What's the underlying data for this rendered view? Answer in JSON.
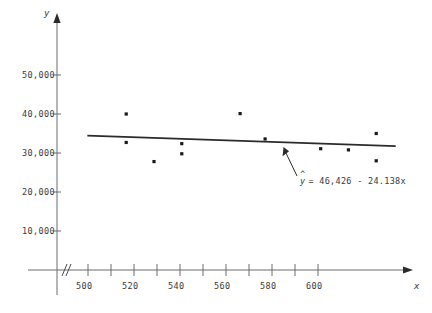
{
  "chart_data": {
    "type": "scatter",
    "title": "",
    "xlabel": "x",
    "ylabel": "y",
    "xlim": [
      493,
      610
    ],
    "ylim": [
      0,
      57000
    ],
    "grid": false,
    "legend": "none",
    "axis_break": "//",
    "x_ticks": [
      500,
      510,
      520,
      530,
      540,
      550,
      560,
      570,
      580,
      590,
      600
    ],
    "x_tick_labels": [
      "500",
      "",
      "520",
      "",
      "540",
      "",
      "560",
      "",
      "580",
      "",
      "600"
    ],
    "y_ticks": [
      10000,
      20000,
      30000,
      40000,
      50000
    ],
    "y_tick_labels": [
      "10,000",
      "20,000",
      "30,000",
      "40,000",
      "50,000"
    ],
    "points": [
      {
        "x": 510,
        "y": 40000
      },
      {
        "x": 510,
        "y": 32700
      },
      {
        "x": 520,
        "y": 27800
      },
      {
        "x": 530,
        "y": 32400
      },
      {
        "x": 530,
        "y": 29800
      },
      {
        "x": 551,
        "y": 40100
      },
      {
        "x": 560,
        "y": 33600
      },
      {
        "x": 580,
        "y": 31100
      },
      {
        "x": 590,
        "y": 30800
      },
      {
        "x": 600,
        "y": 35000
      },
      {
        "x": 600,
        "y": 28000
      }
    ],
    "fit_line": {
      "intercept": 46426,
      "slope": -24.138,
      "x_start": 496,
      "x_end": 607,
      "equation_text": "= 46,426 - 24.138x",
      "equation_symbol": "y",
      "equation_hat": "^",
      "annotation_target": {
        "x": 580,
        "y": 32426
      }
    },
    "colors": {
      "line": "#2b2b2b",
      "point": "#1a1a1a",
      "axis": "#55565a",
      "text": "#3a3a3a"
    }
  }
}
